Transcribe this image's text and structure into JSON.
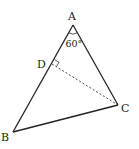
{
  "diagram": {
    "type": "geometry-triangle",
    "points": {
      "A": {
        "label": "A",
        "x": 73,
        "y": 25
      },
      "B": {
        "label": "B",
        "x": 13,
        "y": 132
      },
      "C": {
        "label": "C",
        "x": 118,
        "y": 105
      },
      "D": {
        "label": "D",
        "x": 52,
        "y": 64
      }
    },
    "angle_label": "60°",
    "segments": [
      "AB",
      "BC",
      "CA"
    ],
    "dashed_segments": [
      "DC"
    ],
    "right_angle_at": "D",
    "colors": {
      "line": "#222222",
      "dashed": "#333333",
      "background": "#ffffff"
    }
  }
}
